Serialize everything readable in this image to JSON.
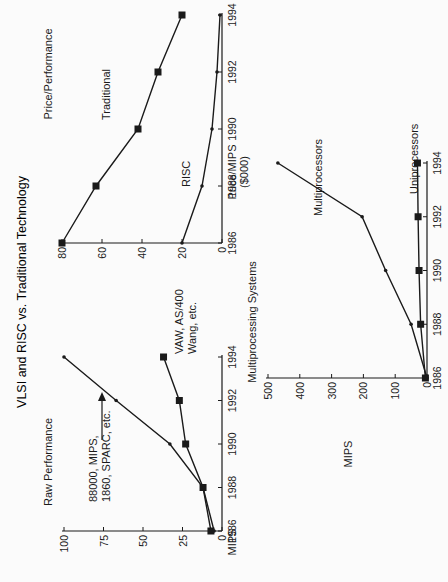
{
  "title": "VLSI and RISC vs. Traditional Technology",
  "colors": {
    "ink": "#1a1a1a",
    "background": "#fbfbfb"
  },
  "chart_data": [
    {
      "id": "raw-performance",
      "type": "line",
      "title": "Raw Performance",
      "xlabel": "",
      "ylabel": "MIPS",
      "x": [
        1986,
        1988,
        1990,
        1992,
        1994
      ],
      "x_ticks": [
        "1986",
        "1988",
        "1990",
        "1992",
        "1994"
      ],
      "y_ticks": [
        "0",
        "25",
        "50",
        "75",
        "100"
      ],
      "ylim": [
        0,
        100
      ],
      "grid": false,
      "series": [
        {
          "name": "88000, MIPS, 1860, SPARC, etc.",
          "marker": "dot",
          "values": [
            5,
            12,
            33,
            67,
            100
          ]
        },
        {
          "name": "VAW, AS/400 Wang, etc.",
          "marker": "square",
          "values": [
            7,
            12,
            23,
            27,
            37
          ]
        }
      ],
      "annotations": [
        {
          "text_lines": [
            "88000, MIPS,",
            "1860, SPARC, etc."
          ],
          "arrow_to": {
            "x": 1992.3,
            "y": 75
          }
        },
        {
          "text_lines": [
            "VAW, AS/400",
            "Wang, etc."
          ]
        }
      ]
    },
    {
      "id": "price-performance",
      "type": "line",
      "title": "Price/Performance",
      "xlabel": "",
      "ylabel_lines": [
        "Price/MIPS",
        "($000)"
      ],
      "x": [
        1986,
        1988,
        1990,
        1992,
        1994
      ],
      "x_ticks": [
        "1986",
        "1988",
        "1990",
        "1992",
        "1994"
      ],
      "y_ticks": [
        "0",
        "20",
        "40",
        "60",
        "80"
      ],
      "ylim": [
        0,
        80
      ],
      "grid": false,
      "series": [
        {
          "name": "Traditional",
          "marker": "square",
          "values": [
            80,
            63,
            42,
            32,
            20
          ]
        },
        {
          "name": "RISC",
          "marker": "dot",
          "values": [
            20,
            10,
            5,
            2.5,
            1
          ]
        }
      ]
    },
    {
      "id": "multiprocessing-systems",
      "type": "line",
      "title": "Multiprocessing Systems",
      "xlabel": "",
      "ylabel": "MIPS",
      "x": [
        1986,
        1988,
        1990,
        1992,
        1994
      ],
      "x_ticks": [
        "1986",
        "1988",
        "1990",
        "1992",
        "1994"
      ],
      "y_ticks": [
        "0",
        "100",
        "200",
        "300",
        "400",
        "500"
      ],
      "ylim": [
        0,
        500
      ],
      "grid": false,
      "series": [
        {
          "name": "Multiprocessors",
          "marker": "dot",
          "values": [
            0,
            50,
            130,
            204,
            469
          ]
        },
        {
          "name": "Uniprocessors",
          "marker": "square",
          "values": [
            5,
            20,
            25,
            28,
            30
          ]
        }
      ]
    }
  ]
}
